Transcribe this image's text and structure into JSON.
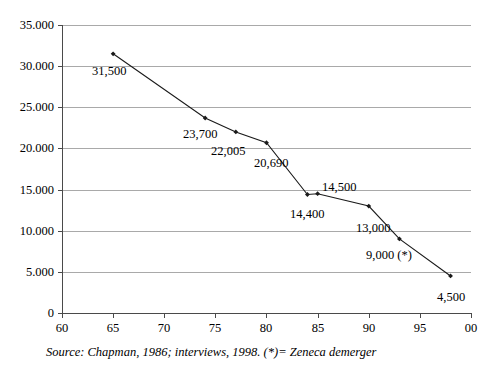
{
  "chart_data": {
    "type": "line",
    "title": "",
    "subtitle": "",
    "xlabel": "",
    "ylabel": "",
    "xlim": [
      60,
      100
    ],
    "ylim": [
      0,
      35000
    ],
    "grid": true,
    "legend": "none",
    "x_tick_labels": [
      "60",
      "65",
      "70",
      "75",
      "80",
      "85",
      "90",
      "95",
      "00"
    ],
    "x_tick_values": [
      60,
      65,
      70,
      75,
      80,
      85,
      90,
      95,
      100
    ],
    "y_tick_labels": [
      "0",
      "5.000",
      "10.000",
      "15.000",
      "20.000",
      "25.000",
      "30.000",
      "35.000"
    ],
    "y_tick_values": [
      0,
      5000,
      10000,
      15000,
      20000,
      25000,
      30000,
      35000
    ],
    "series": [
      {
        "name": "employees",
        "x": [
          65,
          74,
          77,
          80,
          84,
          85,
          90,
          93,
          98
        ],
        "values": [
          31500,
          23700,
          22005,
          20690,
          14400,
          14500,
          13000,
          9000,
          4500
        ],
        "point_labels": [
          "31,500",
          "23,700",
          "22,005",
          "20,690",
          "14,400",
          "14,500",
          "13,000",
          "9,000 (*)",
          "4,500"
        ],
        "marker": "diamond",
        "color": "#1a1a1a"
      }
    ],
    "annotations": [
      {
        "name": "source-note",
        "text": "Source: Chapman, 1986; interviews, 1998. (*)= Zeneca demerger"
      }
    ]
  },
  "labels": {
    "p0": "31,500",
    "p1": "23,700",
    "p2": "22,005",
    "p3": "20,690",
    "p4": "14,400",
    "p5": "14,500",
    "p6": "13,000",
    "p7": "9,000 (*)",
    "p8": "4,500"
  },
  "axis": {
    "y0": "0",
    "y1": "5.000",
    "y2": "10.000",
    "y3": "15.000",
    "y4": "20.000",
    "y5": "25.000",
    "y6": "30.000",
    "y7": "35.000",
    "x0": "60",
    "x1": "65",
    "x2": "70",
    "x3": "75",
    "x4": "80",
    "x5": "85",
    "x6": "90",
    "x7": "95",
    "x8": "00"
  },
  "note": {
    "source": "Source: Chapman, 1986; interviews, 1998. (*)= Zeneca demerger"
  },
  "colors": {
    "line": "#1a1a1a",
    "grid": "#a9a9a9",
    "axis": "#4a4a4a",
    "text": "#000000",
    "background": "#ffffff"
  }
}
